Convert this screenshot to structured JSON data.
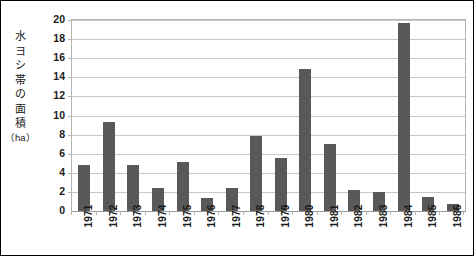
{
  "chart_data": {
    "type": "bar",
    "title": "",
    "subtitle": "",
    "xlabel": "",
    "ylabel": "水ヨシ帯の面積（ha）",
    "ylabel_chars": [
      "水",
      "ヨ",
      "シ",
      "帯",
      "の",
      "面",
      "積",
      "（ha）"
    ],
    "categories": [
      "1971",
      "1972",
      "1973",
      "1974",
      "1975",
      "1976",
      "1977",
      "1978",
      "1979",
      "1980",
      "1981",
      "1982",
      "1983",
      "1984",
      "1985",
      "1986"
    ],
    "values": [
      4.8,
      9.3,
      4.8,
      2.4,
      5.1,
      1.4,
      2.4,
      7.9,
      5.5,
      14.9,
      7.0,
      2.2,
      2.0,
      19.7,
      1.5,
      0.7
    ],
    "ylim": [
      0,
      20
    ],
    "ytick_values": [
      0,
      2,
      4,
      6,
      8,
      10,
      12,
      14,
      16,
      18,
      20
    ],
    "ytick_labels": [
      "0",
      "2",
      "4",
      "6",
      "8",
      "10",
      "12",
      "14",
      "16",
      "18",
      "20"
    ],
    "grid": true,
    "grid_axis": "y",
    "legend": false,
    "legend_position": "none",
    "bar_color": "#595959",
    "gridline_color": "#c8c8c8",
    "axis_color": "#b4b4b4",
    "frame_color": "#000000",
    "background_color": "#ffffff",
    "text_color": "#1a1a1a"
  }
}
